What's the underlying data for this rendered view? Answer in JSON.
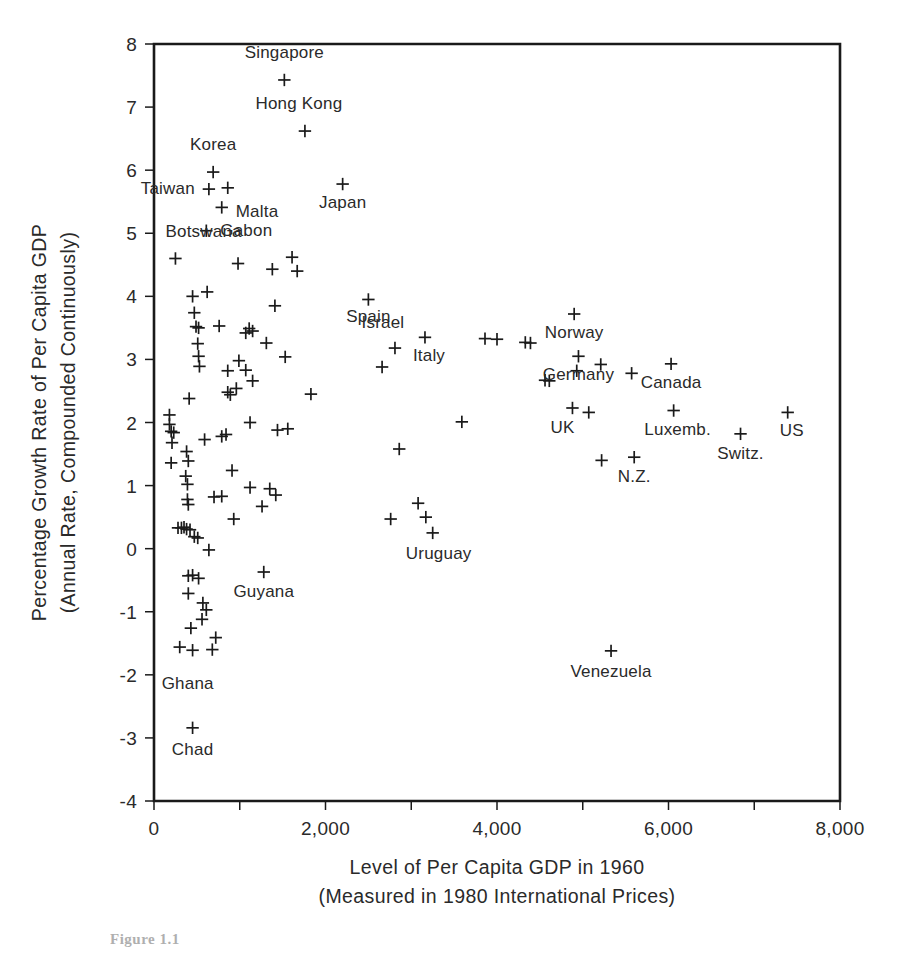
{
  "figure": {
    "caption_stub": "Figure 1.1"
  },
  "chart_data": {
    "type": "scatter",
    "title": "",
    "xlabel": "Level of Per Capita GDP in 1960",
    "xlabel_line2": "(Measured in 1980 International Prices)",
    "ylabel": "Percentage Growth Rate of Per Capita GDP",
    "ylabel_line2": "(Annual Rate, Compounded Continuously)",
    "xlim": [
      0,
      8000
    ],
    "ylim": [
      -4,
      8
    ],
    "xticks": [
      0,
      1000,
      2000,
      3000,
      4000,
      5000,
      6000,
      7000,
      8000
    ],
    "xticklabels": [
      "0",
      "",
      "2,000",
      "",
      "4,000",
      "",
      "6,000",
      "",
      "8,000"
    ],
    "yticks": [
      -4,
      -3,
      -2,
      -1,
      0,
      1,
      2,
      3,
      4,
      5,
      6,
      7,
      8
    ],
    "yticklabels": [
      "-4",
      "-3",
      "-2",
      "-1",
      "0",
      "1",
      "2",
      "3",
      "4",
      "5",
      "6",
      "7",
      "8"
    ],
    "grid": false,
    "legend": "none",
    "marker": "plus",
    "marker_color": "#1a1a1a",
    "points": [
      {
        "x": 1520,
        "y": 7.43,
        "label": "Singapore",
        "lx": 0,
        "ly": -22,
        "anchor": "middle"
      },
      {
        "x": 1760,
        "y": 6.62,
        "label": "Hong Kong",
        "lx": -6,
        "ly": -22,
        "anchor": "middle"
      },
      {
        "x": 690,
        "y": 5.97,
        "label": "Korea",
        "lx": 0,
        "ly": -22,
        "anchor": "middle"
      },
      {
        "x": 640,
        "y": 5.7,
        "label": "Taiwan",
        "lx": -14,
        "ly": 5,
        "anchor": "end"
      },
      {
        "x": 860,
        "y": 5.72,
        "label": "",
        "lx": 0,
        "ly": 0,
        "anchor": "middle"
      },
      {
        "x": 2200,
        "y": 5.78,
        "label": "Japan",
        "lx": 0,
        "ly": 24,
        "anchor": "middle"
      },
      {
        "x": 790,
        "y": 5.41,
        "label": "Malta",
        "lx": 14,
        "ly": 10,
        "anchor": "start"
      },
      {
        "x": 610,
        "y": 5.04,
        "label": "Gabon",
        "lx": 14,
        "ly": 5,
        "anchor": "start"
      },
      {
        "x": 250,
        "y": 4.6,
        "label": "Botswana",
        "lx": -10,
        "ly": -21,
        "anchor": "start"
      },
      {
        "x": 980,
        "y": 4.52,
        "label": "",
        "lx": 0,
        "ly": 0,
        "anchor": "middle"
      },
      {
        "x": 1380,
        "y": 4.43,
        "label": "",
        "lx": 0,
        "ly": 0,
        "anchor": "middle"
      },
      {
        "x": 1610,
        "y": 4.62,
        "label": "",
        "lx": 0,
        "ly": 0,
        "anchor": "middle"
      },
      {
        "x": 1670,
        "y": 4.4,
        "label": "",
        "lx": 0,
        "ly": 0,
        "anchor": "middle"
      },
      {
        "x": 450,
        "y": 4.0,
        "label": "",
        "lx": 0,
        "ly": 0,
        "anchor": "middle"
      },
      {
        "x": 620,
        "y": 4.07,
        "label": "",
        "lx": 0,
        "ly": 0,
        "anchor": "middle"
      },
      {
        "x": 1410,
        "y": 3.85,
        "label": "",
        "lx": 0,
        "ly": 0,
        "anchor": "middle"
      },
      {
        "x": 2500,
        "y": 3.95,
        "label": "Spain",
        "lx": 0,
        "ly": 23,
        "anchor": "middle"
      },
      {
        "x": 470,
        "y": 3.74,
        "label": "",
        "lx": 0,
        "ly": 0,
        "anchor": "middle"
      },
      {
        "x": 490,
        "y": 3.52,
        "label": "",
        "lx": 0,
        "ly": 0,
        "anchor": "middle"
      },
      {
        "x": 520,
        "y": 3.5,
        "label": "",
        "lx": 0,
        "ly": 0,
        "anchor": "middle"
      },
      {
        "x": 760,
        "y": 3.53,
        "label": "",
        "lx": 0,
        "ly": 0,
        "anchor": "middle"
      },
      {
        "x": 1070,
        "y": 3.42,
        "label": "",
        "lx": 0,
        "ly": 0,
        "anchor": "middle"
      },
      {
        "x": 1110,
        "y": 3.49,
        "label": "",
        "lx": 0,
        "ly": 0,
        "anchor": "middle"
      },
      {
        "x": 1150,
        "y": 3.45,
        "label": "",
        "lx": 0,
        "ly": 0,
        "anchor": "middle"
      },
      {
        "x": 1310,
        "y": 3.26,
        "label": "",
        "lx": 0,
        "ly": 0,
        "anchor": "middle"
      },
      {
        "x": 2810,
        "y": 3.18,
        "label": "Israel",
        "lx": -12,
        "ly": -20,
        "anchor": "middle"
      },
      {
        "x": 3160,
        "y": 3.35,
        "label": "Italy",
        "lx": 4,
        "ly": 24,
        "anchor": "middle"
      },
      {
        "x": 510,
        "y": 3.25,
        "label": "",
        "lx": 0,
        "ly": 0,
        "anchor": "middle"
      },
      {
        "x": 520,
        "y": 3.05,
        "label": "",
        "lx": 0,
        "ly": 0,
        "anchor": "middle"
      },
      {
        "x": 530,
        "y": 2.89,
        "label": "",
        "lx": 0,
        "ly": 0,
        "anchor": "middle"
      },
      {
        "x": 1530,
        "y": 3.04,
        "label": "",
        "lx": 0,
        "ly": 0,
        "anchor": "middle"
      },
      {
        "x": 2660,
        "y": 2.88,
        "label": "",
        "lx": 0,
        "ly": 0,
        "anchor": "middle"
      },
      {
        "x": 3860,
        "y": 3.33,
        "label": "",
        "lx": 0,
        "ly": 0,
        "anchor": "middle"
      },
      {
        "x": 4000,
        "y": 3.32,
        "label": "",
        "lx": 0,
        "ly": 0,
        "anchor": "middle"
      },
      {
        "x": 4330,
        "y": 3.27,
        "label": "",
        "lx": 0,
        "ly": 0,
        "anchor": "middle"
      },
      {
        "x": 4390,
        "y": 3.26,
        "label": "",
        "lx": 0,
        "ly": 0,
        "anchor": "middle"
      },
      {
        "x": 4900,
        "y": 3.72,
        "label": "Norway",
        "lx": 0,
        "ly": 24,
        "anchor": "middle"
      },
      {
        "x": 4950,
        "y": 3.05,
        "label": "Germany",
        "lx": 0,
        "ly": 24,
        "anchor": "middle"
      },
      {
        "x": 4930,
        "y": 2.82,
        "label": "",
        "lx": 0,
        "ly": 0,
        "anchor": "middle"
      },
      {
        "x": 5210,
        "y": 2.92,
        "label": "",
        "lx": 0,
        "ly": 0,
        "anchor": "middle"
      },
      {
        "x": 6030,
        "y": 2.93,
        "label": "Canada",
        "lx": 0,
        "ly": 24,
        "anchor": "middle"
      },
      {
        "x": 4560,
        "y": 2.67,
        "label": "",
        "lx": 0,
        "ly": 0,
        "anchor": "middle"
      },
      {
        "x": 4610,
        "y": 2.66,
        "label": "",
        "lx": 0,
        "ly": 0,
        "anchor": "middle"
      },
      {
        "x": 5570,
        "y": 2.78,
        "label": "",
        "lx": 0,
        "ly": 0,
        "anchor": "middle"
      },
      {
        "x": 860,
        "y": 2.82,
        "label": "",
        "lx": 0,
        "ly": 0,
        "anchor": "middle"
      },
      {
        "x": 990,
        "y": 2.98,
        "label": "",
        "lx": 0,
        "ly": 0,
        "anchor": "middle"
      },
      {
        "x": 1070,
        "y": 2.83,
        "label": "",
        "lx": 0,
        "ly": 0,
        "anchor": "middle"
      },
      {
        "x": 1150,
        "y": 2.66,
        "label": "",
        "lx": 0,
        "ly": 0,
        "anchor": "middle"
      },
      {
        "x": 860,
        "y": 2.48,
        "label": "",
        "lx": 0,
        "ly": 0,
        "anchor": "middle"
      },
      {
        "x": 890,
        "y": 2.44,
        "label": "",
        "lx": 0,
        "ly": 0,
        "anchor": "middle"
      },
      {
        "x": 960,
        "y": 2.54,
        "label": "",
        "lx": 0,
        "ly": 0,
        "anchor": "middle"
      },
      {
        "x": 1830,
        "y": 2.45,
        "label": "",
        "lx": 0,
        "ly": 0,
        "anchor": "middle"
      },
      {
        "x": 410,
        "y": 2.38,
        "label": "",
        "lx": 0,
        "ly": 0,
        "anchor": "middle"
      },
      {
        "x": 6060,
        "y": 2.19,
        "label": "Luxemb.",
        "lx": 4,
        "ly": 24,
        "anchor": "middle"
      },
      {
        "x": 7390,
        "y": 2.16,
        "label": "US",
        "lx": 4,
        "ly": 24,
        "anchor": "middle"
      },
      {
        "x": 180,
        "y": 2.12,
        "label": "",
        "lx": 0,
        "ly": 0,
        "anchor": "middle"
      },
      {
        "x": 180,
        "y": 1.97,
        "label": "",
        "lx": 0,
        "ly": 0,
        "anchor": "middle"
      },
      {
        "x": 200,
        "y": 1.86,
        "label": "",
        "lx": 0,
        "ly": 0,
        "anchor": "middle"
      },
      {
        "x": 230,
        "y": 1.84,
        "label": "",
        "lx": 0,
        "ly": 0,
        "anchor": "middle"
      },
      {
        "x": 210,
        "y": 1.68,
        "label": "",
        "lx": 0,
        "ly": 0,
        "anchor": "middle"
      },
      {
        "x": 1120,
        "y": 2.0,
        "label": "",
        "lx": 0,
        "ly": 0,
        "anchor": "middle"
      },
      {
        "x": 1440,
        "y": 1.88,
        "label": "",
        "lx": 0,
        "ly": 0,
        "anchor": "middle"
      },
      {
        "x": 1560,
        "y": 1.9,
        "label": "",
        "lx": 0,
        "ly": 0,
        "anchor": "middle"
      },
      {
        "x": 3590,
        "y": 2.01,
        "label": "",
        "lx": 0,
        "ly": 0,
        "anchor": "middle"
      },
      {
        "x": 4880,
        "y": 2.23,
        "label": "UK",
        "lx": -10,
        "ly": 25,
        "anchor": "middle"
      },
      {
        "x": 5070,
        "y": 2.16,
        "label": "",
        "lx": 0,
        "ly": 0,
        "anchor": "middle"
      },
      {
        "x": 6840,
        "y": 1.82,
        "label": "Switz.",
        "lx": 0,
        "ly": 25,
        "anchor": "middle"
      },
      {
        "x": 590,
        "y": 1.73,
        "label": "",
        "lx": 0,
        "ly": 0,
        "anchor": "middle"
      },
      {
        "x": 790,
        "y": 1.78,
        "label": "",
        "lx": 0,
        "ly": 0,
        "anchor": "middle"
      },
      {
        "x": 840,
        "y": 1.81,
        "label": "",
        "lx": 0,
        "ly": 0,
        "anchor": "middle"
      },
      {
        "x": 2860,
        "y": 1.58,
        "label": "",
        "lx": 0,
        "ly": 0,
        "anchor": "middle"
      },
      {
        "x": 5220,
        "y": 1.4,
        "label": "",
        "lx": 0,
        "ly": 0,
        "anchor": "middle"
      },
      {
        "x": 5600,
        "y": 1.45,
        "label": "N.Z.",
        "lx": 0,
        "ly": 25,
        "anchor": "middle"
      },
      {
        "x": 380,
        "y": 1.54,
        "label": "",
        "lx": 0,
        "ly": 0,
        "anchor": "middle"
      },
      {
        "x": 400,
        "y": 1.39,
        "label": "",
        "lx": 0,
        "ly": 0,
        "anchor": "middle"
      },
      {
        "x": 200,
        "y": 1.36,
        "label": "",
        "lx": 0,
        "ly": 0,
        "anchor": "middle"
      },
      {
        "x": 910,
        "y": 1.24,
        "label": "",
        "lx": 0,
        "ly": 0,
        "anchor": "middle"
      },
      {
        "x": 370,
        "y": 1.15,
        "label": "",
        "lx": 0,
        "ly": 0,
        "anchor": "middle"
      },
      {
        "x": 390,
        "y": 1.02,
        "label": "",
        "lx": 0,
        "ly": 0,
        "anchor": "middle"
      },
      {
        "x": 1120,
        "y": 0.97,
        "label": "",
        "lx": 0,
        "ly": 0,
        "anchor": "middle"
      },
      {
        "x": 1350,
        "y": 0.95,
        "label": "",
        "lx": 0,
        "ly": 0,
        "anchor": "middle"
      },
      {
        "x": 1420,
        "y": 0.85,
        "label": "",
        "lx": 0,
        "ly": 0,
        "anchor": "middle"
      },
      {
        "x": 3080,
        "y": 0.72,
        "label": "",
        "lx": 0,
        "ly": 0,
        "anchor": "middle"
      },
      {
        "x": 3170,
        "y": 0.5,
        "label": "",
        "lx": 0,
        "ly": 0,
        "anchor": "middle"
      },
      {
        "x": 3250,
        "y": 0.25,
        "label": "Uruguay",
        "lx": 6,
        "ly": 26,
        "anchor": "middle"
      },
      {
        "x": 2760,
        "y": 0.47,
        "label": "",
        "lx": 0,
        "ly": 0,
        "anchor": "middle"
      },
      {
        "x": 390,
        "y": 0.78,
        "label": "",
        "lx": 0,
        "ly": 0,
        "anchor": "middle"
      },
      {
        "x": 400,
        "y": 0.7,
        "label": "",
        "lx": 0,
        "ly": 0,
        "anchor": "middle"
      },
      {
        "x": 700,
        "y": 0.82,
        "label": "",
        "lx": 0,
        "ly": 0,
        "anchor": "middle"
      },
      {
        "x": 790,
        "y": 0.83,
        "label": "",
        "lx": 0,
        "ly": 0,
        "anchor": "middle"
      },
      {
        "x": 1260,
        "y": 0.67,
        "label": "",
        "lx": 0,
        "ly": 0,
        "anchor": "middle"
      },
      {
        "x": 930,
        "y": 0.47,
        "label": "",
        "lx": 0,
        "ly": 0,
        "anchor": "middle"
      },
      {
        "x": 280,
        "y": 0.33,
        "label": "",
        "lx": 0,
        "ly": 0,
        "anchor": "middle"
      },
      {
        "x": 320,
        "y": 0.33,
        "label": "",
        "lx": 0,
        "ly": 0,
        "anchor": "middle"
      },
      {
        "x": 350,
        "y": 0.34,
        "label": "",
        "lx": 0,
        "ly": 0,
        "anchor": "middle"
      },
      {
        "x": 380,
        "y": 0.31,
        "label": "",
        "lx": 0,
        "ly": 0,
        "anchor": "middle"
      },
      {
        "x": 420,
        "y": 0.3,
        "label": "",
        "lx": 0,
        "ly": 0,
        "anchor": "middle"
      },
      {
        "x": 470,
        "y": 0.19,
        "label": "",
        "lx": 0,
        "ly": 0,
        "anchor": "middle"
      },
      {
        "x": 510,
        "y": 0.17,
        "label": "",
        "lx": 0,
        "ly": 0,
        "anchor": "middle"
      },
      {
        "x": 640,
        "y": -0.02,
        "label": "",
        "lx": 0,
        "ly": 0,
        "anchor": "middle"
      },
      {
        "x": 400,
        "y": -0.43,
        "label": "",
        "lx": 0,
        "ly": 0,
        "anchor": "middle"
      },
      {
        "x": 450,
        "y": -0.42,
        "label": "",
        "lx": 0,
        "ly": 0,
        "anchor": "middle"
      },
      {
        "x": 520,
        "y": -0.47,
        "label": "",
        "lx": 0,
        "ly": 0,
        "anchor": "middle"
      },
      {
        "x": 1280,
        "y": -0.37,
        "label": "Guyana",
        "lx": 0,
        "ly": 25,
        "anchor": "middle"
      },
      {
        "x": 400,
        "y": -0.71,
        "label": "",
        "lx": 0,
        "ly": 0,
        "anchor": "middle"
      },
      {
        "x": 570,
        "y": -0.86,
        "label": "",
        "lx": 0,
        "ly": 0,
        "anchor": "middle"
      },
      {
        "x": 610,
        "y": -0.97,
        "label": "",
        "lx": 0,
        "ly": 0,
        "anchor": "middle"
      },
      {
        "x": 560,
        "y": -1.12,
        "label": "",
        "lx": 0,
        "ly": 0,
        "anchor": "middle"
      },
      {
        "x": 430,
        "y": -1.26,
        "label": "",
        "lx": 0,
        "ly": 0,
        "anchor": "middle"
      },
      {
        "x": 720,
        "y": -1.41,
        "label": "",
        "lx": 0,
        "ly": 0,
        "anchor": "middle"
      },
      {
        "x": 300,
        "y": -1.56,
        "label": "Ghana",
        "lx": 8,
        "ly": 42,
        "anchor": "middle"
      },
      {
        "x": 450,
        "y": -1.61,
        "label": "",
        "lx": 0,
        "ly": 0,
        "anchor": "middle"
      },
      {
        "x": 680,
        "y": -1.6,
        "label": "",
        "lx": 0,
        "ly": 0,
        "anchor": "middle"
      },
      {
        "x": 5330,
        "y": -1.62,
        "label": "Venezuela",
        "lx": 0,
        "ly": 26,
        "anchor": "middle"
      },
      {
        "x": 450,
        "y": -2.84,
        "label": "Chad",
        "lx": 0,
        "ly": 27,
        "anchor": "middle"
      }
    ]
  }
}
